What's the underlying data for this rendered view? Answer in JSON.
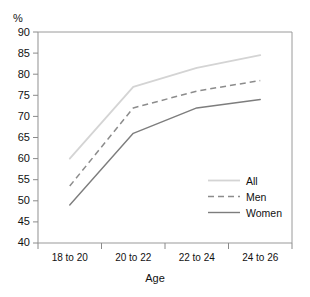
{
  "axis": {
    "y_unit_label": "%",
    "x_title": "Age",
    "y_ticks": [
      "90",
      "85",
      "80",
      "75",
      "70",
      "65",
      "60",
      "55",
      "50",
      "45",
      "40"
    ],
    "x_ticks": [
      "18 to 20",
      "20 to 22",
      "22 to 24",
      "24 to 26"
    ]
  },
  "legend": {
    "entries": [
      {
        "label": "All",
        "style": "solid-light",
        "color": "#d0d0d0"
      },
      {
        "label": "Men",
        "style": "dashed",
        "color": "#8a8a8a"
      },
      {
        "label": "Women",
        "style": "solid",
        "color": "#7a7a7a"
      }
    ]
  },
  "colors": {
    "all_line": "#d4d4d4",
    "men_line": "#8c8c8c",
    "women_line": "#7d7d7d",
    "frame": "#9a9a9a",
    "text": "#111111",
    "background": "#ffffff"
  },
  "chart_data": {
    "type": "line",
    "title": "",
    "xlabel": "Age",
    "ylabel": "%",
    "categories": [
      "18 to 20",
      "20 to 22",
      "22 to 24",
      "24 to 26"
    ],
    "ylim": [
      40,
      90
    ],
    "ytick_step": 5,
    "grid": false,
    "legend_position": "inside-lower-right",
    "series": [
      {
        "name": "All",
        "values": [
          60.0,
          77.0,
          81.5,
          84.5
        ]
      },
      {
        "name": "Men",
        "values": [
          53.5,
          72.0,
          76.0,
          78.5
        ]
      },
      {
        "name": "Women",
        "values": [
          49.0,
          66.0,
          72.0,
          74.0
        ]
      }
    ]
  }
}
